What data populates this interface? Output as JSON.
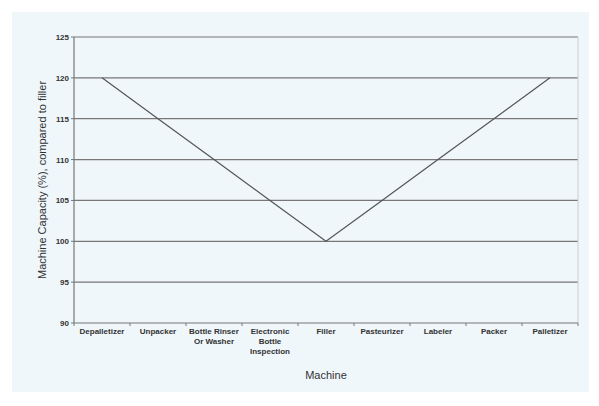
{
  "chart_data": {
    "type": "line",
    "title": "",
    "xlabel": "Machine",
    "ylabel": "Machine Capacity (%), compared to filler",
    "categories": [
      "Depalletizer",
      "Unpacker",
      "Bottle Rinser Or Washer",
      "Electronic Bottle Inspection",
      "Filler",
      "Pasteurizer",
      "Labeler",
      "Packer",
      "Palletizer"
    ],
    "category_lines": [
      [
        "Depalletizer"
      ],
      [
        "Unpacker"
      ],
      [
        "Bottle Rinser",
        "Or Washer"
      ],
      [
        "Electronic",
        "Bottle",
        "Inspection"
      ],
      [
        "Filler"
      ],
      [
        "Pasteurizer"
      ],
      [
        "Labeler"
      ],
      [
        "Packer"
      ],
      [
        "Palletizer"
      ]
    ],
    "series": [
      {
        "name": "Machine Capacity",
        "values": [
          120,
          115,
          110,
          105,
          100,
          105,
          110,
          115,
          120
        ],
        "color": "#555555"
      }
    ],
    "ylim": [
      90,
      125
    ],
    "yticks": [
      90,
      95,
      100,
      105,
      110,
      115,
      120,
      125
    ],
    "grid": true,
    "legend": null
  },
  "colors": {
    "background": "#f0f7fb",
    "gridline": "#777777",
    "axis": "#777777",
    "line": "#555555",
    "text": "#333333"
  }
}
